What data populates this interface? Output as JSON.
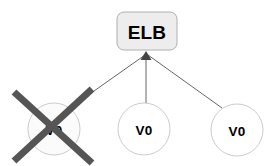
{
  "diagram": {
    "type": "node-graph",
    "background_color": "#ffffff",
    "title_node": {
      "id": "elb",
      "label": "ELB",
      "shape": "rounded-rectangle",
      "x": 117,
      "y": 12,
      "width": 60,
      "height": 38,
      "corner_radius": 7,
      "fill_color": "#ededed",
      "border_color": "#b0b0b0",
      "text_color": "#000000"
    },
    "nodes": [
      {
        "id": "vm-1",
        "label": "V0",
        "shape": "circle",
        "cx": 54,
        "cy": 129,
        "r": 26,
        "fill_color": "#fbfbfb",
        "border_color": "#cccccc",
        "text_color": "#000000",
        "crossed_out": true,
        "status": "disabled"
      },
      {
        "id": "vm-2",
        "label": "V0",
        "shape": "circle",
        "cx": 144,
        "cy": 129,
        "r": 26,
        "fill_color": "#ffffff",
        "border_color": "#cccccc",
        "text_color": "#000000",
        "crossed_out": false,
        "status": "active"
      },
      {
        "id": "vm-3",
        "label": "V0",
        "shape": "circle",
        "cx": 237,
        "cy": 130,
        "r": 26,
        "fill_color": "#ffffff",
        "border_color": "#cccccc",
        "text_color": "#000000",
        "crossed_out": false,
        "status": "active"
      }
    ],
    "edges": [
      {
        "id": "edge-vm1-elb",
        "from": "vm-1",
        "to": "elb",
        "x1": 70,
        "y1": 108,
        "x2": 145,
        "y2": 55,
        "color": "#666666",
        "width": 1
      },
      {
        "id": "edge-vm2-elb",
        "from": "vm-2",
        "to": "elb",
        "x1": 146,
        "y1": 103,
        "x2": 146,
        "y2": 55,
        "color": "#666666",
        "width": 1
      },
      {
        "id": "edge-vm3-elb",
        "from": "vm-3",
        "to": "elb",
        "x1": 222,
        "y1": 108,
        "x2": 148,
        "y2": 55,
        "color": "#666666",
        "width": 1
      }
    ],
    "arrowhead": {
      "id": "arrowhead-elb",
      "x": 146,
      "y": 51,
      "color": "#444444",
      "width": 11,
      "height": 9
    },
    "cross_mark": {
      "id": "cross-out-vm-1",
      "color": "#555555",
      "stroke_width": 7,
      "line_a": {
        "x1": 14,
        "y1": 92,
        "x2": 92,
        "y2": 163
      },
      "line_b": {
        "x1": 92,
        "y1": 89,
        "x2": 14,
        "y2": 161
      }
    }
  }
}
